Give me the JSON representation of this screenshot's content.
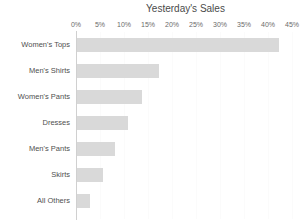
{
  "chart_data": {
    "type": "bar",
    "orientation": "horizontal",
    "title": "Yesterday's Sales",
    "xlabel": "",
    "ylabel": "",
    "categories": [
      "Women's Tops",
      "Men's Shirts",
      "Women's Pants",
      "Dresses",
      "Men's Pants",
      "Skirts",
      "All Others"
    ],
    "values": [
      42,
      17,
      13.5,
      10.7,
      8,
      5.5,
      2.8
    ],
    "value_unit": "%",
    "xlim": [
      0,
      45
    ],
    "xtick_values": [
      0,
      5,
      10,
      15,
      20,
      25,
      30,
      35,
      40,
      45
    ],
    "xtick_labels": [
      "0%",
      "5%",
      "10%",
      "15%",
      "20%",
      "25%",
      "30%",
      "35%",
      "40%",
      "45%"
    ],
    "xaxis_position": "top",
    "grid": true,
    "grid_axis": "x",
    "legend": false,
    "bar_color": "#d9d9d9",
    "axis_line_color": "#d0d0d0",
    "grid_color": "#fbfbfb",
    "title_color": "#4a4a4a",
    "label_color": "#4f4f4f",
    "background": "#ffffff"
  }
}
